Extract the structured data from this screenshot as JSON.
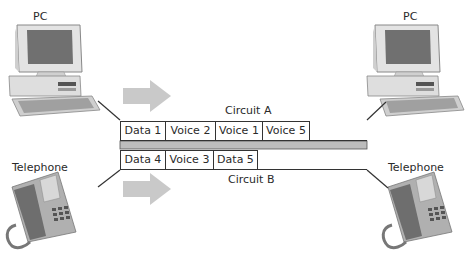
{
  "devices": {
    "pc_left": {
      "label": "PC"
    },
    "pc_right": {
      "label": "PC"
    },
    "phone_left": {
      "label": "Telephone"
    },
    "phone_right": {
      "label": "Telephone"
    }
  },
  "circuits": {
    "a": {
      "label": "Circuit A",
      "cells": [
        "Data 1",
        "Voice 2",
        "Voice 1",
        "Voice 5",
        ""
      ]
    },
    "b": {
      "label": "Circuit B",
      "cells": [
        "Data 4",
        "Voice 3",
        "Data 5",
        ""
      ]
    }
  },
  "colors": {
    "arrow": "#c9c9c9",
    "divider_bar": "#bdbdbd",
    "line": "#333333",
    "device_gray": "#b8b8b8",
    "device_dark": "#6a6a6a"
  },
  "icons": [
    "computer-icon",
    "telephone-icon",
    "right-arrow-icon"
  ]
}
